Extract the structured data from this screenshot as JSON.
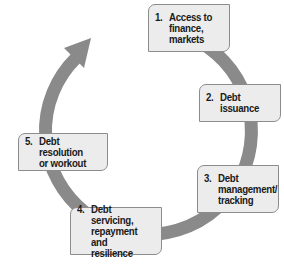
{
  "diagram": {
    "type": "cycle",
    "colors": {
      "arrow": "#8a8a8a",
      "box_fill": "#ececec",
      "box_border": "#8c8c8c",
      "text": "#1a1a1a"
    },
    "stages": [
      {
        "number": "1.",
        "label": "Access to\nfinance,\nmarkets"
      },
      {
        "number": "2.",
        "label": "Debt\nissuance"
      },
      {
        "number": "3.",
        "label": "Debt\nmanagement/\ntracking"
      },
      {
        "number": "4.",
        "label": "Debt servicing,\nrepayment and\nresilience"
      },
      {
        "number": "5.",
        "label": "Debt resolution\nor workout"
      }
    ]
  }
}
